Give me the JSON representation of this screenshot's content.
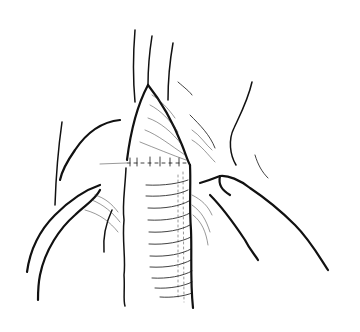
{
  "figure": {
    "type": "line-drawing",
    "subject": "beveled ribbed tubular graft sutured end-to-side onto vessel",
    "colors": {
      "ink": "#111111",
      "background": "#ffffff"
    },
    "caption": ""
  }
}
